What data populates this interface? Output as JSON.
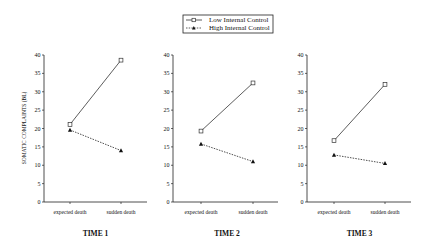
{
  "chart_data": {
    "type": "line",
    "legend": {
      "position": "top-center",
      "entries": [
        {
          "label": "Low Internal Control",
          "marker": "open-square",
          "line": "solid"
        },
        {
          "label": "High Internal Control",
          "marker": "filled-triangle",
          "line": "dashed"
        }
      ]
    },
    "ylabel": "SOMATIC COMPLAINTS (BL)",
    "ylim": [
      0,
      40
    ],
    "yticks": [
      0,
      5,
      10,
      15,
      20,
      25,
      30,
      35,
      40
    ],
    "grid": false,
    "categories": [
      "expected death",
      "sudden death"
    ],
    "panels": [
      {
        "title": "TIME 1",
        "series": [
          {
            "name": "Low Internal Control",
            "values": [
              21.1,
              38.6
            ]
          },
          {
            "name": "High Internal Control",
            "values": [
              19.6,
              14.0
            ]
          }
        ]
      },
      {
        "title": "TIME 2",
        "series": [
          {
            "name": "Low Internal Control",
            "values": [
              19.3,
              32.4
            ]
          },
          {
            "name": "High Internal Control",
            "values": [
              15.8,
              11.0
            ]
          }
        ]
      },
      {
        "title": "TIME 3",
        "series": [
          {
            "name": "Low Internal Control",
            "values": [
              16.7,
              32.0
            ]
          },
          {
            "name": "High Internal Control",
            "values": [
              12.8,
              10.5
            ]
          }
        ]
      }
    ]
  },
  "colors": {
    "axis": "#222222",
    "series_low": "#333333",
    "series_high": "#222222"
  }
}
